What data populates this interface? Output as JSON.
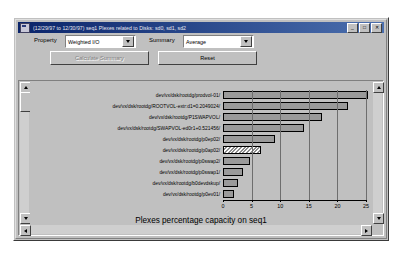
{
  "window": {
    "title": "(12/29/97 to 12/30/97) seq1 Plexes related to Disks: sd0, sd1, sd2",
    "icon": "app-icon",
    "buttons": {
      "minimize": "_",
      "maximize": "□",
      "close": "✕"
    }
  },
  "controls": {
    "property_label": "Property",
    "property_value": "Weighted I/O",
    "summary_label": "Summary",
    "summary_value": "Average",
    "calculate_label": "Calculate Summary",
    "calculate_disabled": true,
    "reset_label": "Reset"
  },
  "scrollbars": {
    "up_arrow": "scroll-up-arrow",
    "down_arrow": "scroll-down-arrow",
    "left_arrow": "scroll-left-arrow",
    "right_arrow": "scroll-right-arrow"
  },
  "chart_data": {
    "type": "bar",
    "orientation": "horizontal",
    "title": "Plexes percentage capacity on seq1",
    "xlabel": "",
    "ylabel": "",
    "xlim": [
      0,
      25
    ],
    "xticks": [
      0,
      5,
      10,
      15,
      20,
      25
    ],
    "grid": true,
    "legend": "none",
    "bar_color": "#9a9a9a",
    "bar_edge_color": "#000000",
    "highlight_pattern": "hatched",
    "categories": [
      "/dev/vx/dsk/rootdg/prodvol-01",
      "/dev/vx/dsk/rootdg/ROOTVOL-extr:d1=0.2049024",
      "/dev/vx/dsk/rootdg/P1SWAPVOL",
      "/dev/vx/dsk/rootdg/SWAPVOL-ed0r1+0.521456",
      "/dev/vx/dsk/rootdg/p0ep02",
      "/dev/vx/dsk/rootdg/p0ap02",
      "/dev/vx/dsk/rootdg/p0swap2",
      "/dev/vx/dsk/rootdg/p0swap1",
      "/dev/vx/dsk/rootdg/b0devdskup",
      "/dev/vx/dsk/rootdg/p0ev01"
    ],
    "values": [
      24.4,
      21.0,
      16.6,
      13.6,
      8.7,
      6.3,
      4.6,
      3.4,
      2.6,
      1.9
    ],
    "highlighted_index": 5
  }
}
